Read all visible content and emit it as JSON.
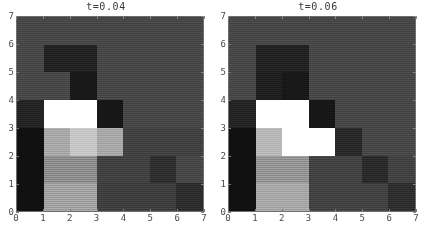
{
  "figure": {
    "kind": "heatmap-pair",
    "background_color": "#ffffff",
    "axis_text_color": "#4a4a4a",
    "frame_color": "#6e6e6e",
    "footnote": ""
  },
  "panels": [
    {
      "title": "t=0.04",
      "xlabel": "",
      "ylabel": "",
      "xticks": [
        "0",
        "1",
        "2",
        "3",
        "4",
        "5",
        "6",
        "7"
      ],
      "yticks": [
        "0",
        "1",
        "2",
        "3",
        "4",
        "5",
        "6",
        "7"
      ]
    },
    {
      "title": "t=0.06",
      "xlabel": "",
      "ylabel": "",
      "xticks": [
        "0",
        "1",
        "2",
        "3",
        "4",
        "5",
        "6",
        "7"
      ],
      "yticks": [
        "0",
        "1",
        "2",
        "3",
        "4",
        "5",
        "6",
        "7"
      ]
    }
  ],
  "chart_data": [
    {
      "type": "heatmap",
      "title": "t=0.04",
      "xlabel": "",
      "ylabel": "",
      "xlim": [
        0,
        7
      ],
      "ylim": [
        0,
        7
      ],
      "grid": false,
      "legend": "none",
      "colormap": "grayscale",
      "vmin": 0.0,
      "vmax": 1.0,
      "x": [
        0,
        1,
        2,
        3,
        4,
        5,
        6
      ],
      "y": [
        0,
        1,
        2,
        3,
        4,
        5,
        6
      ],
      "note": "values are grayscale intensities 0=black 1=white; rows listed top (y=6) to bottom (y=0)",
      "values_top_to_bottom": [
        [
          0.28,
          0.28,
          0.28,
          0.28,
          0.28,
          0.28,
          0.28
        ],
        [
          0.28,
          0.13,
          0.13,
          0.28,
          0.28,
          0.28,
          0.28
        ],
        [
          0.28,
          0.28,
          0.09,
          0.28,
          0.28,
          0.28,
          0.28
        ],
        [
          0.14,
          1.0,
          1.0,
          0.09,
          0.28,
          0.28,
          0.28
        ],
        [
          0.06,
          0.66,
          0.78,
          0.66,
          0.25,
          0.25,
          0.25
        ],
        [
          0.06,
          0.55,
          0.55,
          0.25,
          0.25,
          0.18,
          0.28
        ],
        [
          0.06,
          0.64,
          0.64,
          0.24,
          0.24,
          0.24,
          0.18
        ]
      ],
      "cells_hex_top_to_bottom": [
        [
          "#474747",
          "#474747",
          "#474747",
          "#474747",
          "#474747",
          "#474747",
          "#474747"
        ],
        [
          "#474747",
          "#222222",
          "#222222",
          "#474747",
          "#474747",
          "#474747",
          "#474747"
        ],
        [
          "#474747",
          "#474747",
          "#181818",
          "#474747",
          "#474747",
          "#474747",
          "#474747"
        ],
        [
          "#242424",
          "#ffffff",
          "#ffffff",
          "#171717",
          "#474747",
          "#474747",
          "#474747"
        ],
        [
          "#101010",
          "#a8a8a8",
          "#c6c6c6",
          "#a8a8a8",
          "#414141",
          "#414141",
          "#414141"
        ],
        [
          "#101010",
          "#8d8d8d",
          "#8d8d8d",
          "#414141",
          "#414141",
          "#2e2e2e",
          "#474747"
        ],
        [
          "#101010",
          "#a3a3a3",
          "#a3a3a3",
          "#3e3e3e",
          "#3e3e3e",
          "#3e3e3e",
          "#2d2d2d"
        ]
      ]
    },
    {
      "type": "heatmap",
      "title": "t=0.06",
      "xlabel": "",
      "ylabel": "",
      "xlim": [
        0,
        7
      ],
      "ylim": [
        0,
        7
      ],
      "grid": false,
      "legend": "none",
      "colormap": "grayscale",
      "vmin": 0.0,
      "vmax": 1.0,
      "x": [
        0,
        1,
        2,
        3,
        4,
        5,
        6
      ],
      "y": [
        0,
        1,
        2,
        3,
        4,
        5,
        6
      ],
      "note": "values are grayscale intensities 0=black 1=white; rows listed top (y=6) to bottom (y=0)",
      "values_top_to_bottom": [
        [
          0.28,
          0.28,
          0.28,
          0.28,
          0.28,
          0.28,
          0.28
        ],
        [
          0.28,
          0.13,
          0.13,
          0.28,
          0.28,
          0.28,
          0.28
        ],
        [
          0.28,
          0.12,
          0.09,
          0.28,
          0.28,
          0.28,
          0.28
        ],
        [
          0.14,
          1.0,
          1.0,
          0.09,
          0.28,
          0.28,
          0.28
        ],
        [
          0.06,
          0.72,
          1.0,
          1.0,
          0.16,
          0.28,
          0.28
        ],
        [
          0.06,
          0.58,
          0.58,
          0.26,
          0.26,
          0.16,
          0.26
        ],
        [
          0.06,
          0.66,
          0.66,
          0.26,
          0.26,
          0.26,
          0.18
        ]
      ],
      "cells_hex_top_to_bottom": [
        [
          "#474747",
          "#474747",
          "#474747",
          "#474747",
          "#474747",
          "#474747",
          "#474747"
        ],
        [
          "#474747",
          "#222222",
          "#222222",
          "#474747",
          "#474747",
          "#474747",
          "#474747"
        ],
        [
          "#474747",
          "#1f1f1f",
          "#181818",
          "#474747",
          "#474747",
          "#474747",
          "#474747"
        ],
        [
          "#242424",
          "#ffffff",
          "#ffffff",
          "#171717",
          "#474747",
          "#474747",
          "#474747"
        ],
        [
          "#101010",
          "#b8b8b8",
          "#ffffff",
          "#ffffff",
          "#292929",
          "#474747",
          "#474747"
        ],
        [
          "#101010",
          "#959595",
          "#959595",
          "#424242",
          "#424242",
          "#2a2a2a",
          "#424242"
        ],
        [
          "#101010",
          "#a8a8a8",
          "#a8a8a8",
          "#424242",
          "#424242",
          "#424242",
          "#2e2e2e"
        ]
      ]
    }
  ]
}
